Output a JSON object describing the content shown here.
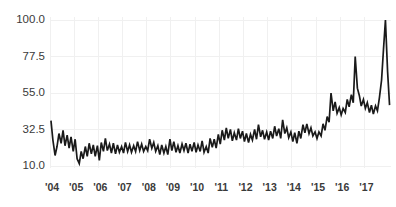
{
  "chart_data": {
    "type": "line",
    "title": "",
    "subtitle": "",
    "xlabel": "",
    "ylabel": "",
    "xlim": [
      2004.0,
      2018.1
    ],
    "ylim": [
      10.0,
      100.0
    ],
    "grid": true,
    "legend": false,
    "legend_position": "none",
    "background_color": "#ffffff",
    "line_color": "#1a1a1a",
    "grid_color": "#f0f0f0",
    "tick_label_color": "#3a3a3a",
    "y_ticks": [
      10.0,
      32.5,
      55.0,
      77.5,
      100.0
    ],
    "y_tick_labels": [
      "10.0",
      "32.5",
      "55.0",
      "77.5",
      "100.0"
    ],
    "x_ticks": [
      2004,
      2005,
      2006,
      2007,
      2008,
      2009,
      2010,
      2011,
      2012,
      2013,
      2014,
      2015,
      2016,
      2017
    ],
    "x_tick_labels": [
      "'04",
      "'05",
      "'06",
      "'07",
      "'08",
      "'09",
      "'10",
      "'11",
      "'12",
      "'13",
      "'14",
      "'15",
      "'16",
      "'17"
    ],
    "series": [
      {
        "name": "series-1",
        "x": [
          2004.04,
          2004.12,
          2004.21,
          2004.29,
          2004.37,
          2004.46,
          2004.54,
          2004.62,
          2004.71,
          2004.79,
          2004.87,
          2004.96,
          2005.04,
          2005.12,
          2005.21,
          2005.29,
          2005.37,
          2005.46,
          2005.54,
          2005.62,
          2005.71,
          2005.79,
          2005.87,
          2005.96,
          2006.04,
          2006.12,
          2006.21,
          2006.29,
          2006.37,
          2006.46,
          2006.54,
          2006.62,
          2006.71,
          2006.79,
          2006.87,
          2006.96,
          2007.04,
          2007.12,
          2007.21,
          2007.29,
          2007.37,
          2007.46,
          2007.54,
          2007.62,
          2007.71,
          2007.79,
          2007.87,
          2007.96,
          2008.04,
          2008.12,
          2008.21,
          2008.29,
          2008.37,
          2008.46,
          2008.54,
          2008.62,
          2008.71,
          2008.79,
          2008.87,
          2008.96,
          2009.04,
          2009.12,
          2009.21,
          2009.29,
          2009.37,
          2009.46,
          2009.54,
          2009.62,
          2009.71,
          2009.79,
          2009.87,
          2009.96,
          2010.04,
          2010.12,
          2010.21,
          2010.29,
          2010.37,
          2010.46,
          2010.54,
          2010.62,
          2010.71,
          2010.79,
          2010.87,
          2010.96,
          2011.04,
          2011.12,
          2011.21,
          2011.29,
          2011.37,
          2011.46,
          2011.54,
          2011.62,
          2011.71,
          2011.79,
          2011.87,
          2011.96,
          2012.04,
          2012.12,
          2012.21,
          2012.29,
          2012.37,
          2012.46,
          2012.54,
          2012.62,
          2012.71,
          2012.79,
          2012.87,
          2012.96,
          2013.04,
          2013.12,
          2013.21,
          2013.29,
          2013.37,
          2013.46,
          2013.54,
          2013.62,
          2013.71,
          2013.79,
          2013.87,
          2013.96,
          2014.04,
          2014.12,
          2014.21,
          2014.29,
          2014.37,
          2014.46,
          2014.54,
          2014.62,
          2014.71,
          2014.79,
          2014.87,
          2014.96,
          2015.04,
          2015.12,
          2015.21,
          2015.29,
          2015.37,
          2015.46,
          2015.54,
          2015.62,
          2015.71,
          2015.79,
          2015.87,
          2015.96,
          2016.04,
          2016.12,
          2016.21,
          2016.29,
          2016.37,
          2016.46,
          2016.54,
          2016.62,
          2016.71,
          2016.79,
          2016.87,
          2016.96,
          2017.04,
          2017.12,
          2017.21,
          2017.29,
          2017.37,
          2017.46,
          2017.54,
          2017.62,
          2017.71,
          2017.79,
          2017.87,
          2017.96,
          2018.04
        ],
        "values": [
          38.0,
          26.0,
          16.5,
          22.0,
          30.0,
          24.0,
          32.0,
          22.5,
          29.0,
          21.0,
          28.0,
          19.0,
          26.5,
          14.5,
          11.5,
          19.0,
          14.5,
          22.0,
          16.0,
          24.0,
          17.5,
          23.0,
          16.0,
          22.5,
          13.5,
          24.5,
          19.0,
          27.0,
          19.5,
          23.5,
          18.0,
          24.0,
          17.5,
          23.0,
          18.5,
          22.0,
          18.0,
          24.5,
          19.0,
          23.0,
          18.5,
          22.5,
          19.0,
          25.0,
          19.5,
          23.5,
          19.0,
          22.0,
          19.5,
          26.5,
          21.0,
          24.5,
          19.0,
          22.5,
          17.0,
          23.0,
          18.0,
          22.0,
          17.0,
          26.5,
          19.5,
          25.0,
          18.5,
          22.5,
          18.0,
          23.5,
          19.5,
          24.0,
          18.0,
          23.5,
          19.0,
          24.5,
          18.5,
          23.0,
          19.0,
          25.5,
          18.5,
          22.0,
          18.0,
          27.0,
          21.5,
          26.5,
          21.0,
          29.5,
          23.5,
          32.0,
          26.0,
          33.5,
          27.0,
          32.5,
          25.5,
          30.5,
          26.0,
          33.0,
          27.0,
          31.5,
          25.0,
          30.0,
          24.5,
          29.5,
          26.0,
          32.5,
          26.5,
          35.5,
          28.0,
          32.0,
          26.5,
          31.0,
          26.0,
          31.5,
          27.0,
          34.5,
          28.5,
          33.0,
          27.0,
          38.5,
          30.0,
          33.5,
          27.5,
          31.0,
          25.0,
          30.5,
          24.0,
          31.5,
          27.0,
          35.5,
          30.5,
          36.0,
          30.0,
          33.5,
          28.5,
          31.0,
          27.0,
          31.0,
          28.5,
          36.0,
          32.0,
          40.5,
          37.0,
          55.0,
          44.0,
          49.5,
          42.5,
          46.0,
          41.5,
          45.5,
          43.0,
          51.0,
          46.5,
          54.0,
          49.0,
          77.5,
          58.0,
          53.5,
          47.0,
          51.0,
          45.5,
          49.0,
          43.0,
          47.5,
          42.0,
          47.0,
          44.0,
          52.0,
          63.0,
          82.0,
          100.0,
          68.0,
          47.5
        ]
      }
    ]
  },
  "axes": {
    "y_axis_name": "value-axis",
    "x_axis_name": "year-axis"
  }
}
